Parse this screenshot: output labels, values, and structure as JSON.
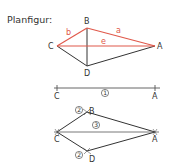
{
  "title": "Planfigur:",
  "colors": {
    "highlight": "#e0584a",
    "line": "#333333"
  },
  "figure_plan": {
    "vertices": {
      "A": "A",
      "B": "B",
      "C": "C",
      "D": "D"
    },
    "side_labels": {
      "a": "a",
      "b": "b",
      "e": "e"
    }
  },
  "construction_step1": {
    "start": "C",
    "end": "A",
    "step": "1"
  },
  "construction_step2": {
    "vertices": {
      "A": "A",
      "B": "B",
      "C": "C",
      "D": "D"
    },
    "step_B": "2",
    "step_D": "2",
    "step_diagonal": "3"
  }
}
